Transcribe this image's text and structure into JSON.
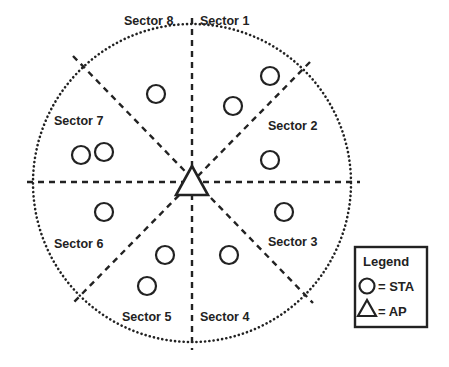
{
  "diagram": {
    "center": {
      "x": 192,
      "y": 183
    },
    "boundary_radius": 159,
    "ap_label": "AP",
    "sectors": [
      {
        "label": "Sector 1",
        "x": 200,
        "y": 25
      },
      {
        "label": "Sector 2",
        "x": 268,
        "y": 130
      },
      {
        "label": "Sector 3",
        "x": 268,
        "y": 246
      },
      {
        "label": "Sector 4",
        "x": 200,
        "y": 321
      },
      {
        "label": "Sector 5",
        "x": 122,
        "y": 321
      },
      {
        "label": "Sector 6",
        "x": 54,
        "y": 248
      },
      {
        "label": "Sector 7",
        "x": 54,
        "y": 125
      },
      {
        "label": "Sector 8",
        "x": 124,
        "y": 25
      }
    ],
    "stations": [
      {
        "x": 270,
        "y": 76
      },
      {
        "x": 233,
        "y": 106
      },
      {
        "x": 270,
        "y": 160
      },
      {
        "x": 284,
        "y": 212
      },
      {
        "x": 229,
        "y": 255
      },
      {
        "x": 165,
        "y": 255
      },
      {
        "x": 147,
        "y": 286
      },
      {
        "x": 104,
        "y": 212
      },
      {
        "x": 156,
        "y": 94
      },
      {
        "x": 104,
        "y": 152
      },
      {
        "x": 81,
        "y": 155
      }
    ],
    "legend": {
      "title": "Legend",
      "items": [
        {
          "symbol": "circle",
          "text": "= STA"
        },
        {
          "symbol": "triangle",
          "text": "= AP"
        }
      ]
    }
  }
}
